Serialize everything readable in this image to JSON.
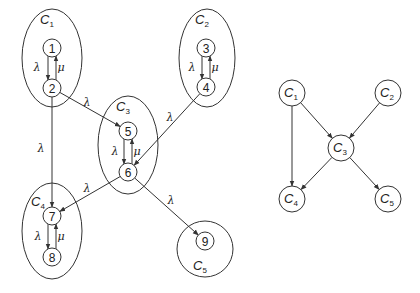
{
  "left_graph": {
    "clusters": [
      {
        "id": "C1",
        "label": "C",
        "sub": "1",
        "shape": "ellipse",
        "cx": 52,
        "cy": 58,
        "rx": 30,
        "ry": 49,
        "lx": 47,
        "ly": 24
      },
      {
        "id": "C2",
        "label": "C",
        "sub": "2",
        "shape": "ellipse",
        "cx": 207,
        "cy": 58,
        "rx": 28,
        "ry": 49,
        "lx": 202,
        "ly": 24
      },
      {
        "id": "C3",
        "label": "C",
        "sub": "3",
        "shape": "ellipse",
        "cx": 128,
        "cy": 145,
        "rx": 30,
        "ry": 49,
        "lx": 123,
        "ly": 111
      },
      {
        "id": "C4",
        "label": "C",
        "sub": "4",
        "shape": "ellipse",
        "cx": 52,
        "cy": 231,
        "rx": 30,
        "ry": 48,
        "lx": 38,
        "ly": 206
      },
      {
        "id": "C5",
        "label": "C",
        "sub": "5",
        "shape": "circle",
        "cx": 205,
        "cy": 249,
        "rx": 28,
        "ry": 28,
        "lx": 200,
        "ly": 270
      }
    ],
    "nodes": [
      {
        "id": "1",
        "label": "1",
        "x": 52,
        "y": 48
      },
      {
        "id": "2",
        "label": "2",
        "x": 52,
        "y": 88
      },
      {
        "id": "3",
        "label": "3",
        "x": 206,
        "y": 48
      },
      {
        "id": "4",
        "label": "4",
        "x": 206,
        "y": 87
      },
      {
        "id": "5",
        "label": "5",
        "x": 128,
        "y": 131
      },
      {
        "id": "6",
        "label": "6",
        "x": 128,
        "y": 172
      },
      {
        "id": "7",
        "label": "7",
        "x": 52,
        "y": 216
      },
      {
        "id": "8",
        "label": "8",
        "x": 52,
        "y": 257
      },
      {
        "id": "9",
        "label": "9",
        "x": 205,
        "y": 241
      }
    ],
    "edges": [
      {
        "from": "1",
        "to": "2",
        "label": "λ",
        "lx": 37,
        "ly": 71
      },
      {
        "from": "2",
        "to": "1",
        "label": "μ",
        "lx": 61,
        "ly": 71
      },
      {
        "from": "3",
        "to": "4",
        "label": "λ",
        "lx": 192,
        "ly": 71
      },
      {
        "from": "4",
        "to": "3",
        "label": "μ",
        "lx": 215,
        "ly": 71
      },
      {
        "from": "5",
        "to": "6",
        "label": "λ",
        "lx": 115,
        "ly": 155
      },
      {
        "from": "6",
        "to": "5",
        "label": "μ",
        "lx": 137,
        "ly": 155
      },
      {
        "from": "7",
        "to": "8",
        "label": "λ",
        "lx": 38,
        "ly": 240
      },
      {
        "from": "8",
        "to": "7",
        "label": "μ",
        "lx": 61,
        "ly": 240
      },
      {
        "from": "2",
        "to": "5",
        "label": "λ",
        "lx": 87,
        "ly": 106
      },
      {
        "from": "4",
        "to": "6",
        "label": "λ",
        "lx": 170,
        "ly": 121
      },
      {
        "from": "2",
        "to": "7",
        "label": "λ",
        "lx": 41,
        "ly": 152
      },
      {
        "from": "6",
        "to": "7",
        "label": "λ",
        "lx": 87,
        "ly": 192
      },
      {
        "from": "6",
        "to": "9",
        "label": "λ",
        "lx": 171,
        "ly": 204
      }
    ]
  },
  "right_graph": {
    "nodes": [
      {
        "id": "C1",
        "label": "C",
        "sub": "1",
        "x": 292,
        "y": 93
      },
      {
        "id": "C2",
        "label": "C",
        "sub": "2",
        "x": 388,
        "y": 93
      },
      {
        "id": "C3",
        "label": "C",
        "sub": "3",
        "x": 341,
        "y": 148
      },
      {
        "id": "C4",
        "label": "C",
        "sub": "4",
        "x": 292,
        "y": 199
      },
      {
        "id": "C5",
        "label": "C",
        "sub": "5",
        "x": 388,
        "y": 199
      }
    ],
    "edges": [
      {
        "from": "C1",
        "to": "C3"
      },
      {
        "from": "C2",
        "to": "C3"
      },
      {
        "from": "C1",
        "to": "C4"
      },
      {
        "from": "C3",
        "to": "C4"
      },
      {
        "from": "C3",
        "to": "C5"
      }
    ]
  }
}
